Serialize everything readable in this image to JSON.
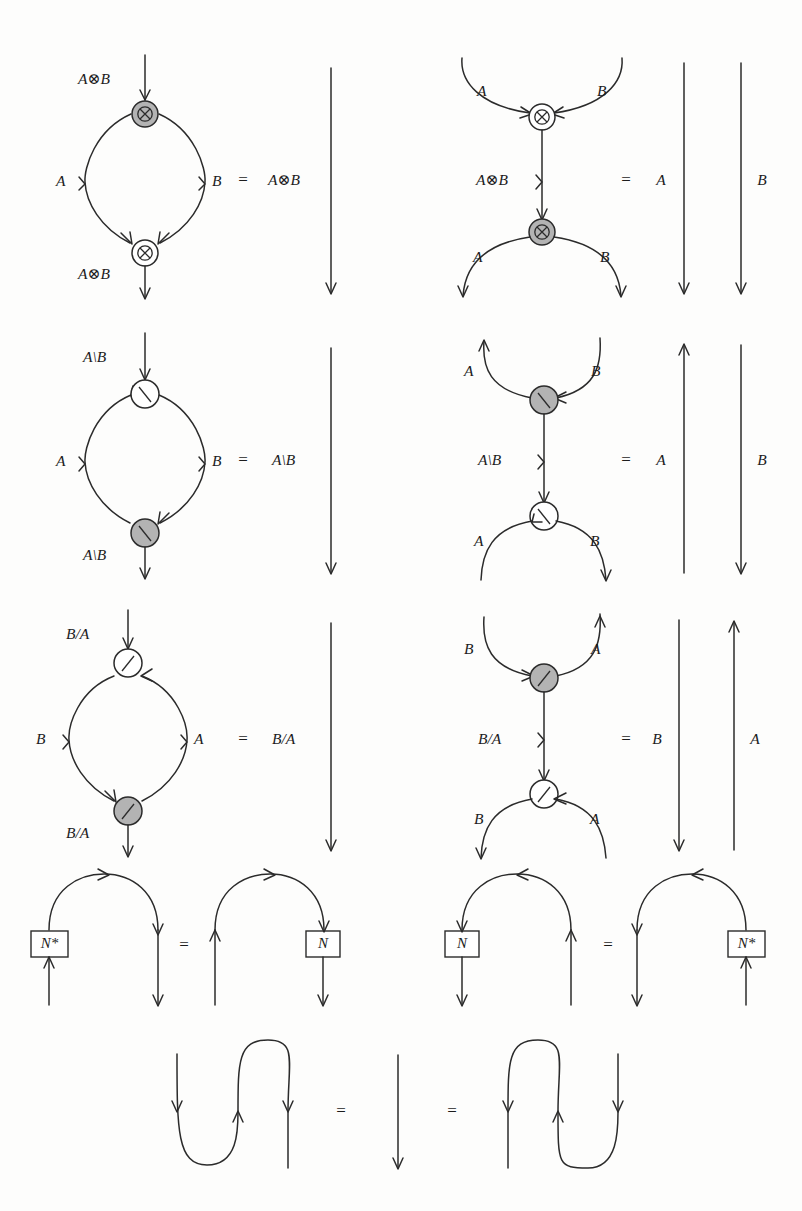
{
  "figure": {
    "width": 802,
    "height": 1211,
    "background_color": "#fdfdfc",
    "wire_color": "#2b2b2b",
    "node_gray_fill": "#b3b3b3",
    "node_white_fill": "#ffffff",
    "equals_sign": "="
  },
  "rows": [
    {
      "id": "row-tensor",
      "name": "tensor-row",
      "left": {
        "name": "tensor-loop-diagram",
        "top_label": "A⊗B",
        "left_label": "A",
        "right_label": "B",
        "bottom_label": "A⊗B",
        "top_node_glyph": "otimes",
        "top_node_fill": "gray",
        "bottom_node_glyph": "otimes",
        "bottom_node_fill": "white"
      },
      "left_result": {
        "name": "tensor-identity-wire",
        "label": "A⊗B"
      },
      "right": {
        "name": "tensor-cocomposition-diagram",
        "upper_left_label": "A",
        "upper_right_label": "B",
        "middle_label": "A⊗B",
        "lower_left_label": "A",
        "lower_right_label": "B",
        "top_node_glyph": "otimes",
        "top_node_fill": "white",
        "bottom_node_glyph": "otimes",
        "bottom_node_fill": "gray"
      },
      "right_result": {
        "name": "tensor-two-wires",
        "left_label": "A",
        "right_label": "B",
        "left_direction": "down",
        "right_direction": "down"
      }
    },
    {
      "id": "row-backslash",
      "name": "left-residual-row",
      "left": {
        "name": "backslash-loop-diagram",
        "top_label": "A\\B",
        "left_label": "A",
        "right_label": "B",
        "bottom_label": "A\\B",
        "top_node_glyph": "backslash",
        "top_node_fill": "white",
        "bottom_node_glyph": "backslash",
        "bottom_node_fill": "gray"
      },
      "left_result": {
        "name": "backslash-identity-wire",
        "label": "A\\B"
      },
      "right": {
        "name": "backslash-cocomposition-diagram",
        "upper_left_label": "A",
        "upper_right_label": "B",
        "middle_label": "A\\B",
        "lower_left_label": "A",
        "lower_right_label": "B",
        "top_node_glyph": "backslash",
        "top_node_fill": "gray",
        "bottom_node_glyph": "backslash",
        "bottom_node_fill": "white"
      },
      "right_result": {
        "name": "backslash-two-wires",
        "left_label": "A",
        "right_label": "B",
        "left_direction": "up",
        "right_direction": "down"
      }
    },
    {
      "id": "row-slash",
      "name": "right-residual-row",
      "left": {
        "name": "slash-loop-diagram",
        "top_label": "B/A",
        "left_label": "B",
        "right_label": "A",
        "bottom_label": "B/A",
        "top_node_glyph": "slash",
        "top_node_fill": "white",
        "bottom_node_glyph": "slash",
        "bottom_node_fill": "gray"
      },
      "left_result": {
        "name": "slash-identity-wire",
        "label": "B/A"
      },
      "right": {
        "name": "slash-cocomposition-diagram",
        "upper_left_label": "B",
        "upper_right_label": "A",
        "middle_label": "B/A",
        "lower_left_label": "B",
        "lower_right_label": "A",
        "top_node_glyph": "slash",
        "top_node_fill": "gray",
        "bottom_node_glyph": "slash",
        "bottom_node_fill": "white"
      },
      "right_result": {
        "name": "slash-two-wires",
        "left_label": "B",
        "right_label": "A",
        "left_direction": "down",
        "right_direction": "up"
      }
    }
  ],
  "dual_row": {
    "id": "row-dual",
    "name": "dual-object-row",
    "pair_one": {
      "name": "dual-cap-left",
      "left_diagram_box": "N*",
      "right_diagram_box": "N",
      "box_side_left": "left",
      "box_side_right": "right",
      "arc_direction": "rightward"
    },
    "pair_two": {
      "name": "dual-cap-right",
      "left_diagram_box": "N",
      "right_diagram_box": "N*",
      "box_side_left": "left",
      "box_side_right": "right",
      "arc_direction": "leftward"
    }
  },
  "zigzag_row": {
    "id": "row-zigzag",
    "name": "snake-equation-row",
    "left_shape": "cup-then-cap",
    "middle_shape": "identity-wire",
    "right_shape": "cap-then-cup"
  },
  "labels_flat": {
    "tensor": "A⊗B",
    "backslash": "A\\B",
    "slash": "B/A",
    "A": "A",
    "B": "B",
    "N": "N",
    "N_star": "N*"
  }
}
